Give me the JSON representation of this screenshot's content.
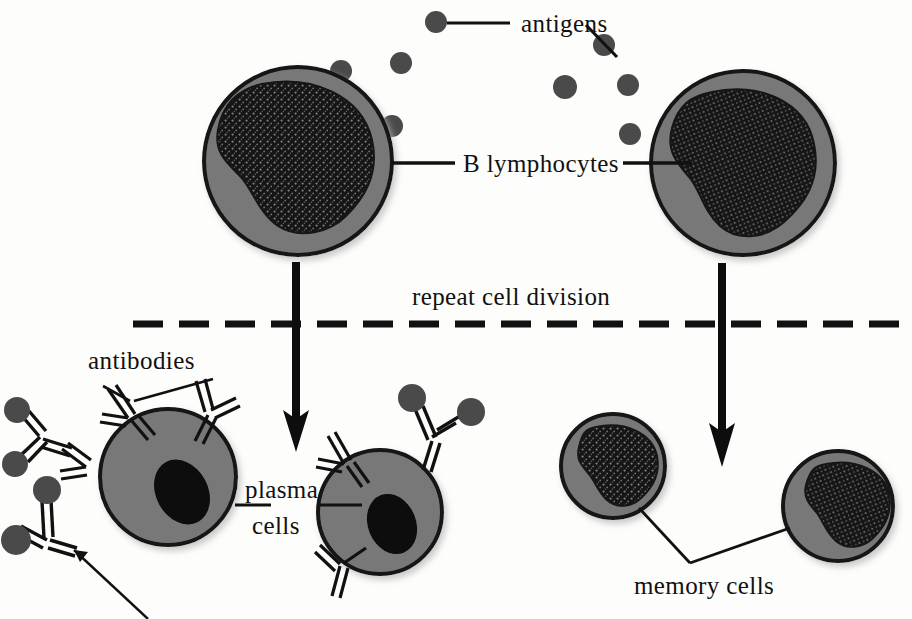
{
  "diagram": {
    "background_color": "#fdfdfb",
    "ink_color": "#111111",
    "cell_body_color": "#787878",
    "cell_outline_color": "#141414",
    "nucleus_color": "#111111",
    "antigen_color": "#4a4a4a",
    "labels": {
      "antigens": "antigens",
      "b_lymphocytes": "B lymphocytes",
      "repeat_cell_division": "repeat cell division",
      "antibodies": "antibodies",
      "plasma_cells_line1": "plasma",
      "plasma_cells_line2": "cells",
      "memory_cells": "memory cells"
    },
    "cells": [
      {
        "id": "b-lymphocyte-left",
        "type": "b-lymphocyte",
        "cx": 298,
        "cy": 161,
        "rx": 94,
        "ry": 94
      },
      {
        "id": "b-lymphocyte-right",
        "type": "b-lymphocyte",
        "cx": 743,
        "cy": 163,
        "rx": 92,
        "ry": 92
      },
      {
        "id": "plasma-cell-left",
        "type": "plasma-cell",
        "cx": 168,
        "cy": 477,
        "rx": 68,
        "ry": 68
      },
      {
        "id": "plasma-cell-right",
        "type": "plasma-cell",
        "cx": 380,
        "cy": 512,
        "rx": 62,
        "ry": 62
      },
      {
        "id": "memory-cell-left",
        "type": "memory-cell",
        "cx": 613,
        "cy": 466,
        "rx": 52,
        "ry": 52
      },
      {
        "id": "memory-cell-right",
        "type": "memory-cell",
        "cx": 838,
        "cy": 506,
        "rx": 55,
        "ry": 55
      }
    ],
    "antigens_free": [
      {
        "cx": 436,
        "cy": 22
      },
      {
        "cx": 401,
        "cy": 63
      },
      {
        "cx": 341,
        "cy": 71
      },
      {
        "cx": 604,
        "cy": 45
      },
      {
        "cx": 565,
        "cy": 87
      },
      {
        "cx": 628,
        "cy": 85
      },
      {
        "cx": 392,
        "cy": 126
      },
      {
        "cx": 630,
        "cy": 134
      }
    ],
    "arrows": [
      {
        "id": "arrow-left",
        "x": 296,
        "y1": 262,
        "y2": 444
      },
      {
        "id": "arrow-right",
        "x": 722,
        "y1": 263,
        "y2": 457
      }
    ],
    "division_line": {
      "x1": 133,
      "x2": 900,
      "y": 324,
      "dash": "30 16",
      "width": 7
    },
    "counts": {
      "b_lymphocytes": 2,
      "plasma_cells": 2,
      "memory_cells": 2,
      "free_antigens": 8
    }
  }
}
